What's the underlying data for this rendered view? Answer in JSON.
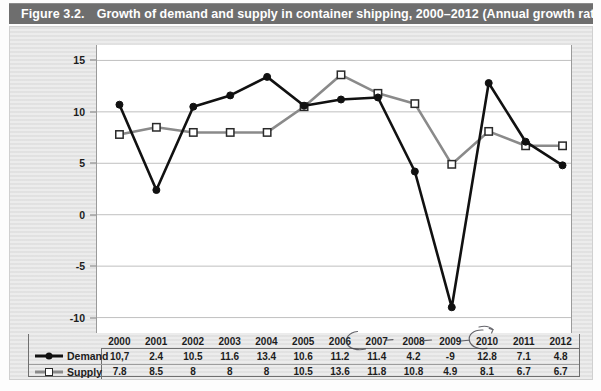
{
  "figure": {
    "number": "Figure 3.2.",
    "title": "Growth of demand and supply in container shipping, 2000–2012 (Annual growth rates)"
  },
  "colors": {
    "header_bar": "#6e6e6e",
    "panel_background": "#e4e4e4",
    "plot_background": "#ffffff",
    "demand_line": "#111111",
    "supply_line": "#8a8a8a",
    "gridline": "#b9b9b9",
    "axis": "#9a9a9a",
    "table_border": "#6f6f6f",
    "text": "#1d1d1d"
  },
  "legend": {
    "demand_label": "Demand",
    "supply_label": "Supply"
  },
  "table": {
    "year_header": [
      "2000",
      "2001",
      "2002",
      "2003",
      "2004",
      "2005",
      "2006",
      "2007",
      "2008",
      "2009",
      "2010",
      "2011",
      "2012"
    ],
    "demand_cells": [
      "10,7",
      "2.4",
      "10.5",
      "11.6",
      "13.4",
      "10.6",
      "11.2",
      "11.4",
      "4.2",
      "-9",
      "12.8",
      "7.1",
      "4.8"
    ],
    "supply_cells": [
      "7.8",
      "8.5",
      "8",
      "8",
      "8",
      "10.5",
      "13.6",
      "11.8",
      "10.8",
      "4.9",
      "8.1",
      "6.7",
      "6.7"
    ]
  },
  "annotations": {
    "pen_marks": "handwritten ink circles around 2007 and 2010 column labels with connecting dashes"
  },
  "chart_data": {
    "type": "line",
    "title": "Growth of demand and supply in container shipping, 2000–2012 (Annual growth rates)",
    "xlabel": "",
    "ylabel": "",
    "categories": [
      "2000",
      "2001",
      "2002",
      "2003",
      "2004",
      "2005",
      "2006",
      "2007",
      "2008",
      "2009",
      "2010",
      "2011",
      "2012"
    ],
    "series": [
      {
        "name": "Demand",
        "values": [
          10.7,
          2.4,
          10.5,
          11.6,
          13.4,
          10.6,
          11.2,
          11.4,
          4.2,
          -9,
          12.8,
          7.1,
          4.8
        ],
        "color": "#111111",
        "marker": "filled-circle"
      },
      {
        "name": "Supply",
        "values": [
          7.8,
          8.5,
          8,
          8,
          8,
          10.5,
          13.6,
          11.8,
          10.8,
          4.9,
          8.1,
          6.7,
          6.7
        ],
        "color": "#8a8a8a",
        "marker": "hollow-square"
      }
    ],
    "ylim": [
      -11.5,
      16.5
    ],
    "yticks": [
      15,
      10,
      5,
      0,
      -5,
      -10
    ],
    "ytick_labels": [
      "15",
      "10",
      "5",
      "0",
      "-5",
      "-10"
    ],
    "grid": true,
    "legend_position": "bottom-table"
  }
}
